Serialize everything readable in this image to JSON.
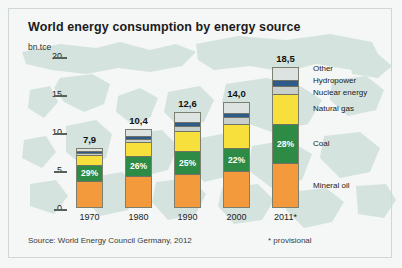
{
  "title": "World energy consumption by energy source",
  "unit": "bn.tce",
  "source": "Source: World Energy Council Germany, 2012",
  "provisional_note": "* provisional",
  "colors": {
    "mineral_oil": "#F29A3C",
    "coal": "#2E8B45",
    "natural_gas": "#F7E03C",
    "nuclear": "#C9CFCB",
    "hydropower": "#2E5C8A",
    "other": "#DCE3E0",
    "background": "#f4f7f6",
    "map": "#bcd3cc"
  },
  "chart_data": {
    "type": "bar",
    "title": "World energy consumption by energy source",
    "xlabel": "",
    "ylabel": "bn.tce",
    "ylim": [
      0,
      20
    ],
    "yticks": [
      0,
      5,
      10,
      15,
      20
    ],
    "ytick_labels": [
      "0",
      "5",
      "10",
      "15",
      "20"
    ],
    "grid": false,
    "stacked": true,
    "legend_position": "right",
    "categories": [
      "1970",
      "1980",
      "1990",
      "2000",
      "2011*"
    ],
    "totals": [
      7.9,
      10.4,
      12.6,
      14.0,
      18.5
    ],
    "total_labels": [
      "7,9",
      "10,4",
      "12,6",
      "14,0",
      "18,5"
    ],
    "coal_share_labels": [
      "29%",
      "26%",
      "25%",
      "22%",
      "28%"
    ],
    "series": [
      {
        "name": "Mineral oil",
        "color": "#F29A3C",
        "values": [
          3.7,
          4.4,
          4.5,
          4.9,
          6.0
        ]
      },
      {
        "name": "Coal",
        "color": "#2E8B45",
        "values": [
          2.3,
          2.7,
          3.2,
          3.1,
          5.2
        ]
      },
      {
        "name": "Natural gas",
        "color": "#F7E03C",
        "values": [
          1.3,
          1.9,
          2.6,
          3.2,
          4.1
        ]
      },
      {
        "name": "Nuclear energy",
        "color": "#C9CFCB",
        "values": [
          0.1,
          0.3,
          0.7,
          0.9,
          0.9
        ]
      },
      {
        "name": "Hydropower",
        "color": "#2E5C8A",
        "values": [
          0.2,
          0.3,
          0.4,
          0.5,
          0.7
        ]
      },
      {
        "name": "Other",
        "color": "#DCE3E0",
        "values": [
          0.3,
          0.8,
          1.2,
          1.4,
          1.6
        ]
      }
    ]
  },
  "legend": [
    {
      "label": "Other"
    },
    {
      "label": "Hydropower"
    },
    {
      "label": "Nuclear energy"
    },
    {
      "label": "Natural gas"
    },
    {
      "label": "Coal"
    },
    {
      "label": "Mineral oil"
    }
  ]
}
